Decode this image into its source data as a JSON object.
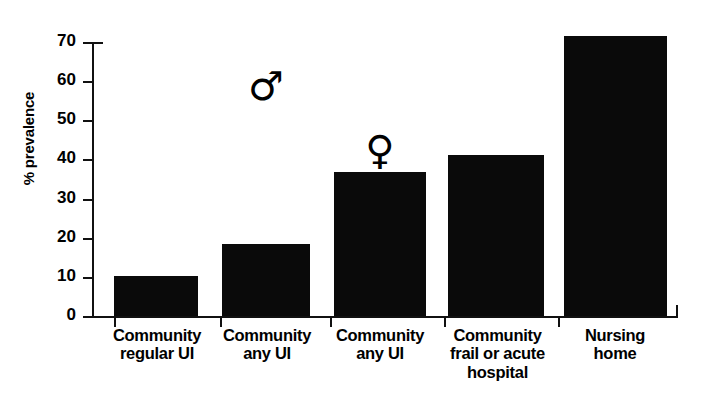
{
  "chart_data": {
    "type": "bar",
    "title": "",
    "xlabel": "",
    "ylabel": "% prevalence",
    "ylim": [
      0,
      70
    ],
    "yticks": [
      0,
      10,
      20,
      30,
      40,
      50,
      60,
      70
    ],
    "grid": false,
    "legend": null,
    "categories": [
      "Community regular UI",
      "Community any UI",
      "Community any UI",
      "Community frail or acute hospital",
      "Nursing home"
    ],
    "category_lines": [
      [
        "Community",
        "regular UI"
      ],
      [
        "Community",
        "any UI"
      ],
      [
        "Community",
        "any UI"
      ],
      [
        "Community",
        "frail or acute",
        "hospital"
      ],
      [
        "Nursing",
        "home"
      ]
    ],
    "values": [
      10.2,
      18.4,
      36.8,
      41.1,
      71.5
    ],
    "annotations": [
      {
        "text": "♂",
        "name": "male-symbol",
        "category_index": 1
      },
      {
        "text": "♀",
        "name": "female-symbol",
        "category_index": 2
      }
    ],
    "bar_color": "#0a0a0a",
    "axis_color": "#111111",
    "background_color": "#ffffff"
  },
  "axis": {
    "ytick_labels": [
      "0",
      "10",
      "20",
      "30",
      "40",
      "50",
      "60",
      "70"
    ],
    "ylabel": "% prevalence"
  },
  "categories": {
    "c0": {
      "l0": "Community",
      "l1": "regular UI",
      "l2": ""
    },
    "c1": {
      "l0": "Community",
      "l1": "any UI",
      "l2": ""
    },
    "c2": {
      "l0": "Community",
      "l1": "any UI",
      "l2": ""
    },
    "c3": {
      "l0": "Community",
      "l1": "frail or acute",
      "l2": "hospital"
    },
    "c4": {
      "l0": "Nursing",
      "l1": "home",
      "l2": ""
    }
  },
  "symbols": {
    "male": "♂",
    "female": "♀"
  }
}
